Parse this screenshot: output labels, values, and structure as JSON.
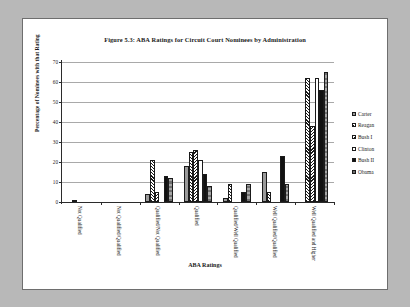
{
  "figure": {
    "title": "Figure 5.3: ABA Ratings for Circuit Court Nominees by Administration",
    "background": "#ffffff",
    "page_background": "#b8b8b8",
    "border_color": "#6e6e6e"
  },
  "axis": {
    "xlabel": "ABA Ratings",
    "ylabel": "Percentage of Nominees with that Rating",
    "yticks": [
      "0",
      "10",
      "20",
      "30",
      "40",
      "50",
      "60",
      "70"
    ]
  },
  "legend": {
    "position": "right",
    "entries": [
      {
        "label": "Carter",
        "pattern": "p-carter",
        "swatch": "gray-dotted"
      },
      {
        "label": "Reagan",
        "pattern": "p-reagan",
        "swatch": "diagonal-hatch-up"
      },
      {
        "label": "Bush I",
        "pattern": "p-bush1",
        "swatch": "diagonal-hatch-down"
      },
      {
        "label": "Clinton",
        "pattern": "p-clinton",
        "swatch": "white-empty"
      },
      {
        "label": "Bush II",
        "pattern": "p-bush2",
        "swatch": "solid-black"
      },
      {
        "label": "Obama",
        "pattern": "p-obama",
        "swatch": "gray-striped"
      }
    ]
  },
  "chart_data": {
    "type": "bar",
    "title": "Figure 5.3: ABA Ratings for Circuit Court Nominees by Administration",
    "xlabel": "ABA Ratings",
    "ylabel": "Percentage of Nominees with that Rating",
    "ylim": [
      0,
      70
    ],
    "ytick_step": 10,
    "grid": true,
    "legend_position": "right",
    "categories": [
      "Not Qualified",
      "Not Qualified/Qualified",
      "Qualified/Not Qualified",
      "Qualified",
      "Qualified/Well Qualified",
      "Well Qualified/Qualified",
      "Well Qualified and Higher"
    ],
    "series": [
      {
        "name": "Carter",
        "values": [
          0,
          0,
          4,
          18,
          2,
          15,
          0
        ]
      },
      {
        "name": "Reagan",
        "values": [
          1,
          0,
          21,
          25,
          9,
          5,
          62
        ]
      },
      {
        "name": "Bush I",
        "values": [
          0,
          0,
          5,
          26,
          0,
          0,
          38
        ]
      },
      {
        "name": "Clinton",
        "values": [
          0,
          0,
          0,
          21,
          0,
          0,
          62
        ]
      },
      {
        "name": "Bush II",
        "values": [
          0,
          0,
          13,
          14,
          5,
          23,
          56
        ]
      },
      {
        "name": "Obama",
        "values": [
          0,
          0,
          12,
          8,
          9,
          9,
          65
        ]
      }
    ]
  }
}
